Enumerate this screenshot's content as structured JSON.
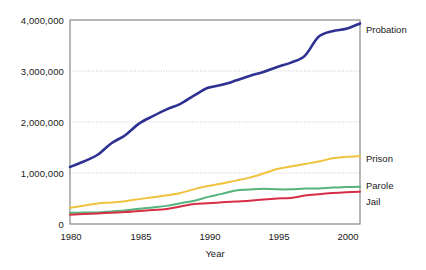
{
  "chart_data": {
    "type": "line",
    "title": "",
    "xlabel": "Year",
    "ylabel": "",
    "xlim": [
      1980,
      2001
    ],
    "ylim": [
      0,
      4000000
    ],
    "grid": true,
    "legend_position": "right-inline",
    "x_ticks": [
      "1980",
      "1985",
      "1990",
      "1995",
      "2000"
    ],
    "x_tick_values": [
      1980,
      1985,
      1990,
      1995,
      2000
    ],
    "y_ticks": [
      "0",
      "1,000,000",
      "2,000,000",
      "3,000,000",
      "4,000,000"
    ],
    "y_tick_values": [
      0,
      1000000,
      2000000,
      3000000,
      4000000
    ],
    "x": [
      1980,
      1981,
      1982,
      1983,
      1984,
      1985,
      1986,
      1987,
      1988,
      1989,
      1990,
      1991,
      1992,
      1993,
      1994,
      1995,
      1996,
      1997,
      1998,
      1999,
      2000,
      2001
    ],
    "series": [
      {
        "name": "Probation",
        "color": "#2e3192",
        "values": [
          1118097,
          1225934,
          1357264,
          1582947,
          1740948,
          1968712,
          2114621,
          2247158,
          2356483,
          2522125,
          2670234,
          2728472,
          2811611,
          2903061,
          2981022,
          3077861,
          3164996,
          3296513,
          3670441,
          3779922,
          3826209,
          3932751
        ]
      },
      {
        "name": "Prison",
        "color": "#efc33f",
        "values": [
          319598,
          360029,
          402914,
          423898,
          448264,
          487593,
          526436,
          562814,
          607766,
          683367,
          743382,
          792535,
          850566,
          909381,
          990147,
          1078542,
          1127528,
          1176564,
          1224469,
          1287172,
          1316333,
          1330007
        ]
      },
      {
        "name": "Parole",
        "color": "#55b37d",
        "values": [
          220438,
          225539,
          224604,
          246440,
          266992,
          300203,
          325638,
          355505,
          407977,
          456803,
          531407,
          590442,
          658601,
          676100,
          690371,
          679421,
          679733,
          694787,
          696385,
          714457,
          723898,
          732333
        ]
      },
      {
        "name": "Jail",
        "color": "#d62f45",
        "values": [
          182288,
          195085,
          207853,
          221815,
          233018,
          254986,
          272735,
          294092,
          341893,
          393303,
          405320,
          424129,
          441781,
          455500,
          479800,
          499300,
          510400,
          557974,
          584372,
          605943,
          621149,
          631240
        ]
      }
    ]
  },
  "labels": {
    "probation": "Probation",
    "prison": "Prison",
    "parole": "Parole",
    "jail": "Jail"
  },
  "axis": {
    "x_title": "Year",
    "y_tick_0": "0",
    "y_tick_1": "1,000,000",
    "y_tick_2": "2,000,000",
    "y_tick_3": "3,000,000",
    "y_tick_4": "4,000,000",
    "x_tick_0": "1980",
    "x_tick_1": "1985",
    "x_tick_2": "1990",
    "x_tick_3": "1995",
    "x_tick_4": "2000"
  }
}
